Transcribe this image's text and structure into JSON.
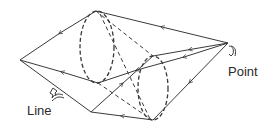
{
  "diagram": {
    "type": "ray-cone-projection",
    "labels": {
      "point": "Point",
      "line": "Line"
    },
    "colors": {
      "stroke": "#3a3a3a",
      "text": "#2a2a2a",
      "background": "#ffffff"
    },
    "vertices": {
      "point": [
        228,
        43
      ],
      "left_apex": [
        20,
        60
      ],
      "bottom_left": [
        91,
        112
      ],
      "ellipse1_top": [
        96,
        11
      ],
      "ellipse1_bottom": [
        98,
        83
      ],
      "ellipse2_top": [
        153,
        56
      ],
      "ellipse2_bottom": [
        153,
        120
      ]
    },
    "ellipses": [
      {
        "name": "near-circle",
        "cx": 97,
        "cy": 47,
        "rx": 18,
        "ry": 36,
        "style": "dashed"
      },
      {
        "name": "far-circle",
        "cx": 153,
        "cy": 88,
        "rx": 16,
        "ry": 32,
        "style": "dashed"
      }
    ]
  }
}
